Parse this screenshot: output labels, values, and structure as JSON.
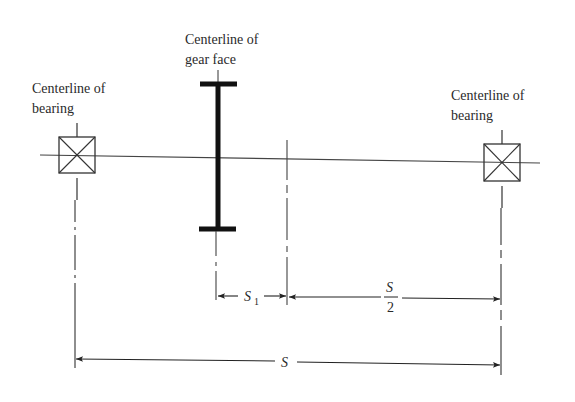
{
  "diagram": {
    "type": "shaft-gear-bearing-layout",
    "labels": {
      "left_bearing": [
        "Centerline of",
        "bearing"
      ],
      "gear_face": [
        "Centerline of",
        "gear face"
      ],
      "right_bearing": [
        "Centerline of",
        "bearing"
      ]
    },
    "dimensions": {
      "s1": {
        "symbol": "S",
        "subscript": "1"
      },
      "half_span": {
        "numerator": "S",
        "denominator": "2"
      },
      "span": {
        "symbol": "S"
      }
    },
    "colors": {
      "line": "#333333",
      "text": "#2a2a2a",
      "background": "#ffffff"
    }
  }
}
